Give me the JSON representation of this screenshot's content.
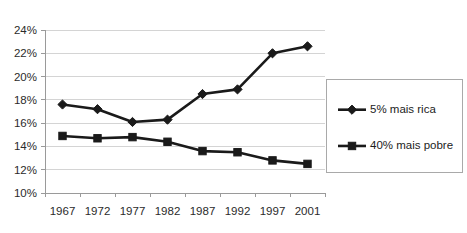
{
  "chart_data": {
    "type": "line",
    "title": "",
    "subtitle": "",
    "xlabel": "",
    "ylabel": "",
    "categories": [
      "1967",
      "1972",
      "1977",
      "1982",
      "1987",
      "1992",
      "1997",
      "2001"
    ],
    "x": [
      1967,
      1972,
      1977,
      1982,
      1987,
      1992,
      1997,
      2001
    ],
    "series": [
      {
        "name": "5% mais rica",
        "marker": "diamond",
        "color": "#1a1a1a",
        "values": [
          17.6,
          17.2,
          16.1,
          16.3,
          18.5,
          18.9,
          22.0,
          22.6
        ]
      },
      {
        "name": "40% mais pobre",
        "marker": "square",
        "color": "#1a1a1a",
        "values": [
          14.9,
          14.7,
          14.8,
          14.4,
          13.6,
          13.5,
          12.8,
          12.5
        ]
      }
    ],
    "ylim": [
      10,
      24
    ],
    "ytick_step": 2,
    "ytick_labels": [
      "24%",
      "22%",
      "20%",
      "18%",
      "16%",
      "14%",
      "12%",
      "10%"
    ],
    "ytick_values": [
      24,
      22,
      20,
      18,
      16,
      14,
      12,
      10
    ],
    "grid": true,
    "grid_axis": "y",
    "legend_position": "right",
    "legend_entries": [
      "5% mais rica",
      "40% mais pobre"
    ],
    "value_suffix": "%"
  },
  "plot": {
    "left": 45,
    "right": 325,
    "top": 30,
    "bottom": 193
  },
  "legend_box": {
    "x": 326,
    "y": 79,
    "width": 136,
    "height": 93
  }
}
